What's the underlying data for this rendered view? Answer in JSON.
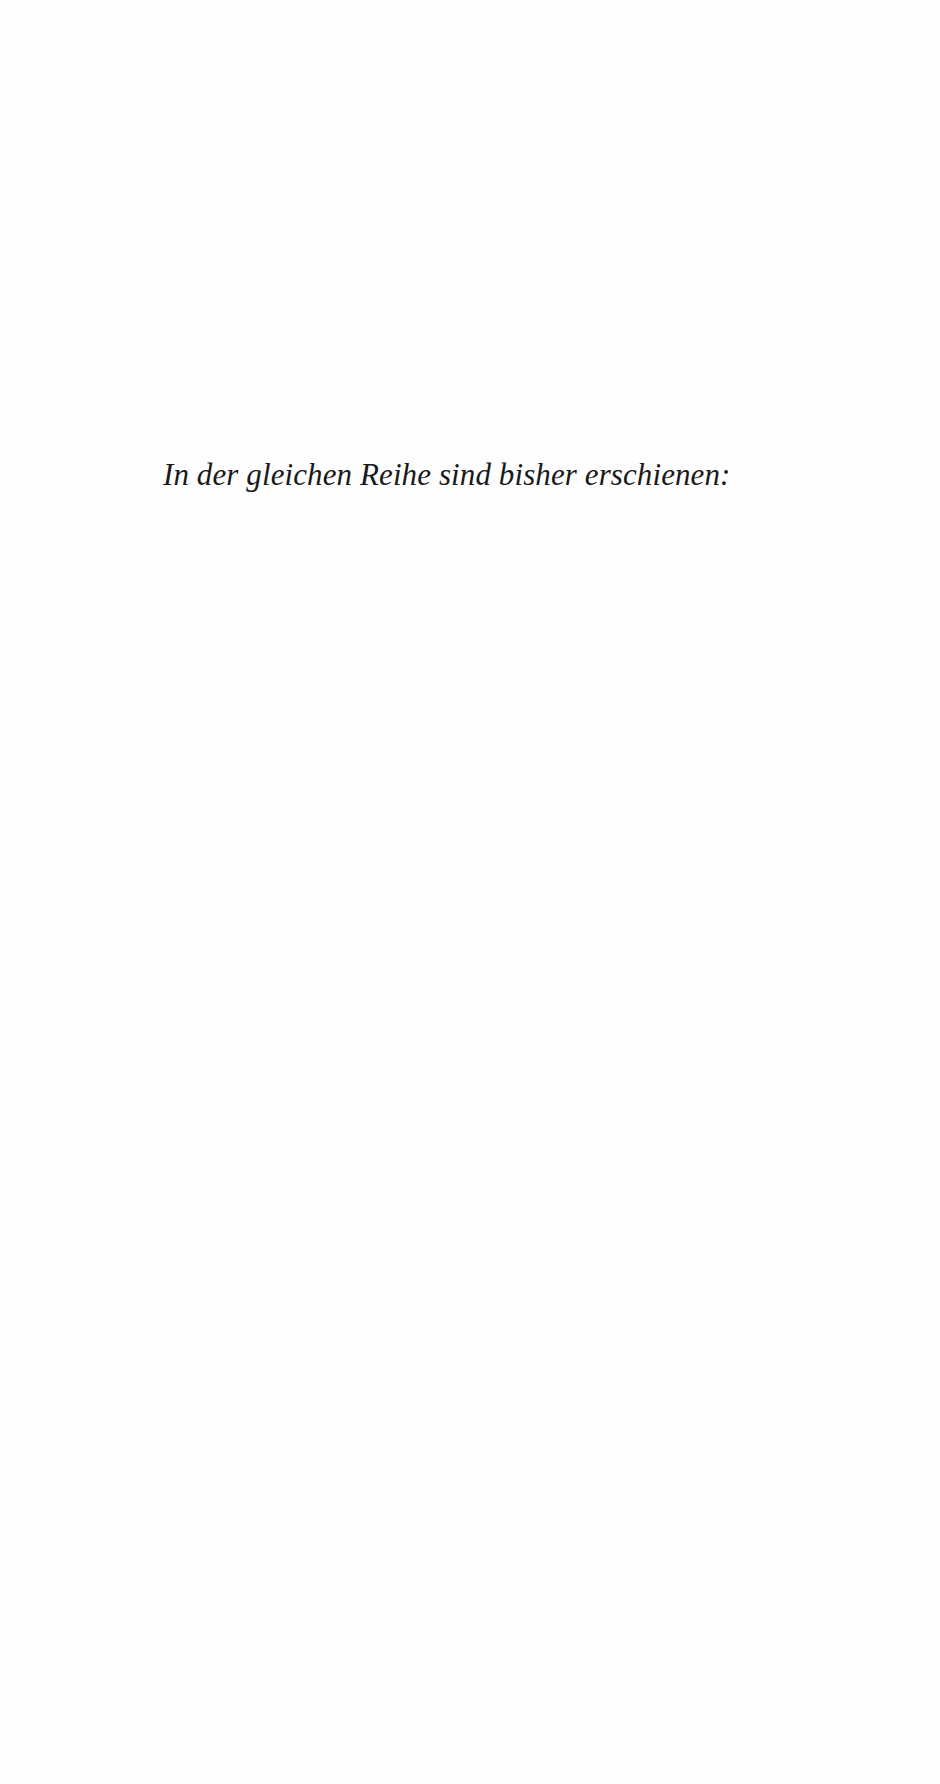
{
  "page": {
    "heading": "In der gleichen Reihe sind bisher erschienen:"
  }
}
